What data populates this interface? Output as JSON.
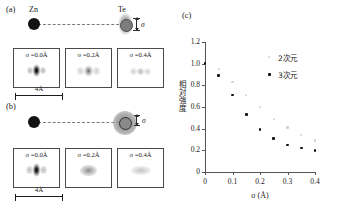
{
  "figure": {
    "panels": [
      {
        "tag": "(a)",
        "atoms": [
          {
            "name": "Zn",
            "label": "Zn"
          },
          {
            "name": "Te",
            "label": "Te"
          }
        ],
        "sigma_annotation": "σ",
        "scale_bar": "4Å",
        "blur_type": "anisotropic-vertical",
        "subpanels": [
          {
            "caption": "σ =0.0Å",
            "sigma": 0.0
          },
          {
            "caption": "σ =0.2Å",
            "sigma": 0.2
          },
          {
            "caption": "σ =0.4Å",
            "sigma": 0.4
          }
        ]
      },
      {
        "tag": "(b)",
        "atoms": [
          {
            "name": "Zn",
            "label": ""
          },
          {
            "name": "Te",
            "label": ""
          }
        ],
        "sigma_annotation": "σ",
        "scale_bar": "4Å",
        "blur_type": "isotropic-spherical",
        "subpanels": [
          {
            "caption": "σ =0.0Å",
            "sigma": 0.0
          },
          {
            "caption": "σ =0.2Å",
            "sigma": 0.2
          },
          {
            "caption": "σ =0.4Å",
            "sigma": 0.4
          }
        ]
      },
      {
        "tag": "(c)"
      }
    ]
  },
  "chart_data": {
    "type": "scatter",
    "title": "",
    "xlabel": "σ (Å)",
    "ylabel": "相対強度",
    "xlim": [
      0,
      0.4
    ],
    "ylim": [
      0,
      1.2
    ],
    "xticks": [
      0,
      0.1,
      0.2,
      0.3,
      0.4
    ],
    "xticklabels": [
      "0",
      "0.1",
      "0.2",
      "0.3",
      "0.4"
    ],
    "yticks": [
      0,
      0.2,
      0.4,
      0.6,
      0.8,
      1.0,
      1.2
    ],
    "yticklabels": [
      "0",
      "0.2",
      "0.4",
      "0.6",
      "0.8",
      "1.0",
      "1.2"
    ],
    "grid": false,
    "legend_position": "top-right",
    "series": [
      {
        "name": "2次元",
        "color": "#d2d2d2",
        "x": [
          0,
          0.05,
          0.1,
          0.15,
          0.2,
          0.25,
          0.3,
          0.35,
          0.4
        ],
        "y": [
          1.0,
          0.95,
          0.83,
          0.71,
          0.6,
          0.49,
          0.41,
          0.34,
          0.29
        ]
      },
      {
        "name": "3次元",
        "color": "#111111",
        "x": [
          0,
          0.05,
          0.1,
          0.15,
          0.2,
          0.25,
          0.3,
          0.35,
          0.4
        ],
        "y": [
          1.0,
          0.89,
          0.71,
          0.53,
          0.39,
          0.31,
          0.25,
          0.22,
          0.2
        ]
      }
    ]
  }
}
